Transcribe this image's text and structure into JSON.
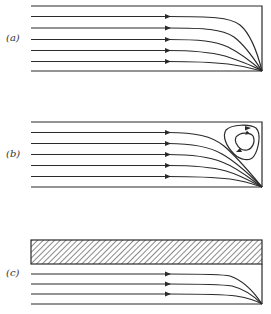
{
  "figure": {
    "stroke_color": "#2a2a2a",
    "panels": [
      {
        "id": "a",
        "label": "(a)",
        "description": "Flow channel with streamlines converging to a sink at the bottom-right corner"
      },
      {
        "id": "b",
        "label": "(b)",
        "description": "Flow channel with streamlines converging to sink and a recirculating eddy in the upper-right corner"
      },
      {
        "id": "c",
        "label": "(c)",
        "description": "Flow channel beneath a hatched solid layer with streamlines converging to sink at bottom-right corner"
      }
    ]
  }
}
